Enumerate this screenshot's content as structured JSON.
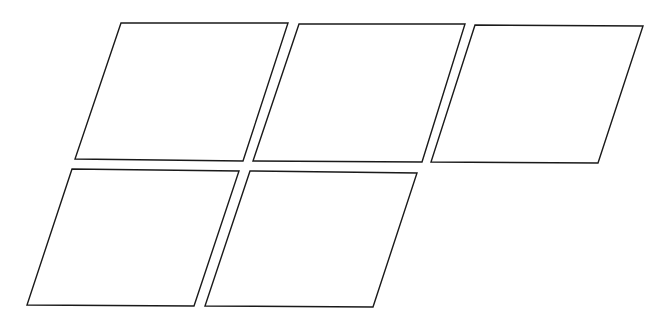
{
  "diagram": {
    "canvas": {
      "width": 672,
      "height": 331,
      "background": "#ffffff"
    },
    "stroke_color": "#1a1a1a",
    "fill_color": "#ffffff",
    "shapes": [
      {
        "type": "parallelogram",
        "row": 1,
        "index": 1,
        "points": [
          [
            121,
            23
          ],
          [
            288,
            23
          ],
          [
            243,
            161
          ],
          [
            75,
            159
          ]
        ]
      },
      {
        "type": "parallelogram",
        "row": 1,
        "index": 2,
        "points": [
          [
            299,
            24
          ],
          [
            465,
            24
          ],
          [
            422,
            162
          ],
          [
            253,
            161
          ]
        ]
      },
      {
        "type": "parallelogram",
        "row": 1,
        "index": 3,
        "points": [
          [
            475,
            25
          ],
          [
            643,
            26
          ],
          [
            598,
            163
          ],
          [
            431,
            162
          ]
        ]
      },
      {
        "type": "parallelogram",
        "row": 2,
        "index": 4,
        "points": [
          [
            72,
            169
          ],
          [
            239,
            171
          ],
          [
            194,
            306
          ],
          [
            27,
            305
          ]
        ]
      },
      {
        "type": "parallelogram",
        "row": 2,
        "index": 5,
        "points": [
          [
            250,
            171
          ],
          [
            417,
            173
          ],
          [
            373,
            307
          ],
          [
            205,
            306
          ]
        ]
      }
    ]
  }
}
